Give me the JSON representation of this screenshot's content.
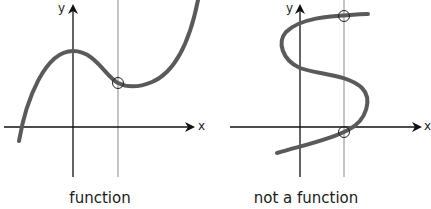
{
  "panels": [
    {
      "caption": "function",
      "x_axis_label": "x",
      "y_axis_label": "y",
      "vertical_line_test": "single intersection"
    },
    {
      "caption": "not a function",
      "x_axis_label": "x",
      "y_axis_label": "y",
      "vertical_line_test": "two intersections"
    }
  ],
  "colors": {
    "curve": "#5a5a5a",
    "axes": "#111111",
    "test_line": "#888888"
  }
}
